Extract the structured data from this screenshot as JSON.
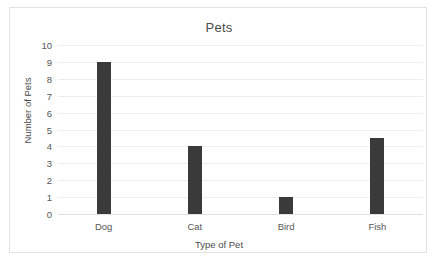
{
  "chart_data": {
    "type": "bar",
    "title": "Pets",
    "xlabel": "Type of Pet",
    "ylabel": "Number of Pets",
    "categories": [
      "Dog",
      "Cat",
      "Bird",
      "Fish"
    ],
    "values": [
      9,
      4,
      1,
      4.5
    ],
    "ylim": [
      0,
      10
    ],
    "yticks": [
      0,
      1,
      2,
      3,
      4,
      5,
      6,
      7,
      8,
      9,
      10
    ],
    "grid": "horizontal",
    "legend": "none",
    "bar_color": "#3a3a3a",
    "gridline_color": "#eeeeee",
    "text_color": "#4a4a4a",
    "background_color": "#ffffff",
    "border_color": "#e3e3e3"
  }
}
